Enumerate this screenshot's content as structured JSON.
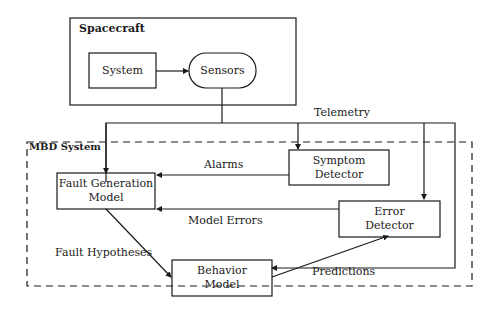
{
  "diagram": {
    "spacecraft": {
      "title": "Spacecraft",
      "system": "System",
      "sensors": "Sensors"
    },
    "telemetry_label": "Telemetry",
    "mbd_system": {
      "title": "MBD System",
      "fault_generation_model": [
        "Fault Generation",
        "Model"
      ],
      "symptom_detector": [
        "Symptom",
        "Detector"
      ],
      "error_detector": [
        "Error",
        "Detector"
      ],
      "behavior_model": [
        "Behavior",
        "Model"
      ]
    },
    "edges": {
      "alarms": "Alarms",
      "model_errors": "Model Errors",
      "fault_hypotheses": "Fault Hypotheses",
      "predictions": "Predictions"
    },
    "colors": {
      "line": "#1a1a1a",
      "background": "#ffffff"
    }
  }
}
